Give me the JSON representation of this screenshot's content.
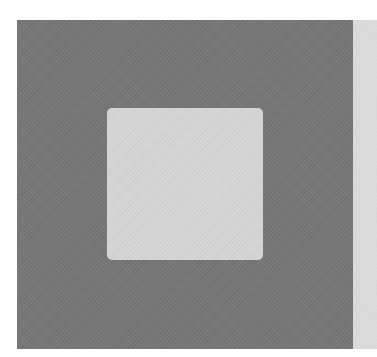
{
  "graphic": {
    "description": "Grayscale abstract composition: dark square with centered light rounded square and a light vertical strip on the right",
    "colors": {
      "background": "#ffffff",
      "outer_square": "#777777",
      "inner_square": "#d4d4d4",
      "side_strip": "#d9d9d9"
    }
  }
}
